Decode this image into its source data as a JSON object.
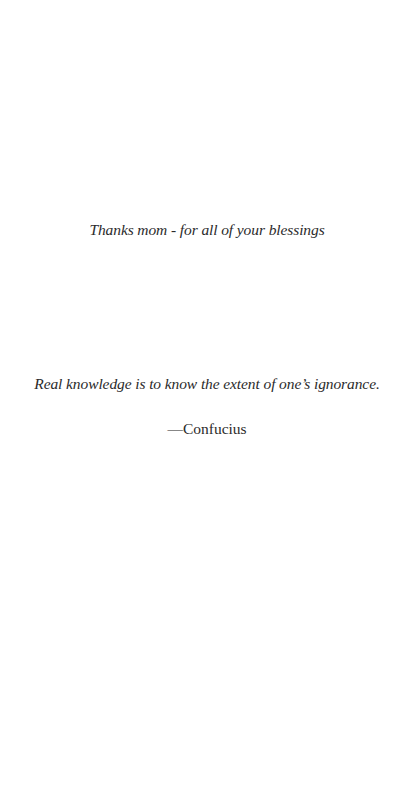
{
  "dedication": {
    "text": "Thanks mom - for all of your blessings"
  },
  "epigraph": {
    "quote": "Real knowledge is to know the extent of one’s ignorance.",
    "attribution": "—Confucius"
  },
  "colors": {
    "background": "#ffffff",
    "text": "#2b2b2b"
  }
}
